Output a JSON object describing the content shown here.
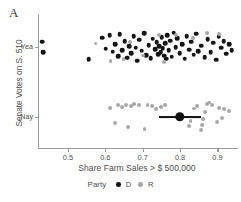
{
  "panel": {
    "label": "A"
  },
  "legend": {
    "title": "Party",
    "position": "bottom",
    "items": [
      {
        "key": "D",
        "label": "D",
        "color": "#151515",
        "name": "Democrat"
      },
      {
        "key": "R",
        "label": "R",
        "color": "#a8a8a8",
        "name": "Republican"
      }
    ]
  },
  "axes": {
    "x": {
      "label": "Share Farm Sales > $ 500,000",
      "ticks": [
        0.5,
        0.6,
        0.7,
        0.8,
        0.9
      ],
      "tick_labels": [
        "0.5",
        "0.6",
        "0.7",
        "0.8",
        "0.9"
      ],
      "range": [
        0.42,
        0.955
      ]
    },
    "y": {
      "label": "Senate Votes on S. 510",
      "ticks": [
        "Yea",
        "Nay"
      ],
      "tick_labels": [
        "Yea",
        "Nay"
      ]
    }
  },
  "colors": {
    "democrat": "#151515",
    "republican": "#a8a8a8",
    "axis": "#9a9a9a",
    "text": "#4d4d4d",
    "estimate": "#111111",
    "background": "#ffffff"
  },
  "chart_data": {
    "type": "scatter",
    "title": "",
    "subtitle": "",
    "xlabel": "Share Farm Sales > $ 500,000",
    "ylabel": "Senate Votes on S. 510",
    "xlim": [
      0.42,
      0.955
    ],
    "ylim": [
      "Nay",
      "Yea"
    ],
    "grid": false,
    "legend": "bottom",
    "y_categories": [
      "Yea",
      "Nay"
    ],
    "series": [
      {
        "name": "D",
        "label": "Democrat",
        "color": "#151515",
        "points": [
          {
            "x": 0.432,
            "y": "Yea",
            "jitter": -0.3
          },
          {
            "x": 0.434,
            "y": "Yea",
            "jitter": 0.32
          },
          {
            "x": 0.556,
            "y": "Yea",
            "jitter": 0.72
          },
          {
            "x": 0.592,
            "y": "Yea",
            "jitter": -0.55
          },
          {
            "x": 0.601,
            "y": "Yea",
            "jitter": 0.1
          },
          {
            "x": 0.612,
            "y": "Yea",
            "jitter": -0.68
          },
          {
            "x": 0.62,
            "y": "Yea",
            "jitter": 0.28
          },
          {
            "x": 0.627,
            "y": "Yea",
            "jitter": -0.18
          },
          {
            "x": 0.634,
            "y": "Yea",
            "jitter": 0.55
          },
          {
            "x": 0.639,
            "y": "Yea",
            "jitter": -0.75
          },
          {
            "x": 0.645,
            "y": "Yea",
            "jitter": 0.18
          },
          {
            "x": 0.652,
            "y": "Yea",
            "jitter": -0.35
          },
          {
            "x": 0.659,
            "y": "Yea",
            "jitter": 0.62
          },
          {
            "x": 0.664,
            "y": "Yea",
            "jitter": -0.05
          },
          {
            "x": 0.67,
            "y": "Yea",
            "jitter": 0.38
          },
          {
            "x": 0.676,
            "y": "Yea",
            "jitter": -0.62
          },
          {
            "x": 0.681,
            "y": "Yea",
            "jitter": 0.05
          },
          {
            "x": 0.686,
            "y": "Yea",
            "jitter": 0.8
          },
          {
            "x": 0.691,
            "y": "Yea",
            "jitter": -0.42
          },
          {
            "x": 0.697,
            "y": "Yea",
            "jitter": 0.22
          },
          {
            "x": 0.704,
            "y": "Yea",
            "jitter": -0.8
          },
          {
            "x": 0.71,
            "y": "Yea",
            "jitter": 0.48
          },
          {
            "x": 0.716,
            "y": "Yea",
            "jitter": -0.12
          },
          {
            "x": 0.722,
            "y": "Yea",
            "jitter": 0.65
          },
          {
            "x": 0.727,
            "y": "Yea",
            "jitter": -0.48
          },
          {
            "x": 0.733,
            "y": "Yea",
            "jitter": 0.12
          },
          {
            "x": 0.737,
            "y": "Yea",
            "jitter": -0.28
          },
          {
            "x": 0.741,
            "y": "Yea",
            "jitter": 0.42
          },
          {
            "x": 0.745,
            "y": "Yea",
            "jitter": -0.05
          },
          {
            "x": 0.748,
            "y": "Yea",
            "jitter": 0.3
          },
          {
            "x": 0.751,
            "y": "Yea",
            "jitter": -0.58
          },
          {
            "x": 0.754,
            "y": "Yea",
            "jitter": 0.08
          },
          {
            "x": 0.757,
            "y": "Yea",
            "jitter": 0.52
          },
          {
            "x": 0.76,
            "y": "Yea",
            "jitter": -0.22
          },
          {
            "x": 0.763,
            "y": "Yea",
            "jitter": 0.7
          },
          {
            "x": 0.766,
            "y": "Yea",
            "jitter": -0.7
          },
          {
            "x": 0.77,
            "y": "Yea",
            "jitter": 0.2
          },
          {
            "x": 0.774,
            "y": "Yea",
            "jitter": -0.38
          },
          {
            "x": 0.778,
            "y": "Yea",
            "jitter": 0.58
          },
          {
            "x": 0.783,
            "y": "Yea",
            "jitter": -0.85
          },
          {
            "x": 0.788,
            "y": "Yea",
            "jitter": 0.0
          },
          {
            "x": 0.793,
            "y": "Yea",
            "jitter": -0.52
          },
          {
            "x": 0.799,
            "y": "Yea",
            "jitter": 0.35
          },
          {
            "x": 0.805,
            "y": "Yea",
            "jitter": -0.15
          },
          {
            "x": 0.812,
            "y": "Yea",
            "jitter": 0.68
          },
          {
            "x": 0.818,
            "y": "Yea",
            "jitter": -0.65
          },
          {
            "x": 0.824,
            "y": "Yea",
            "jitter": 0.15
          },
          {
            "x": 0.83,
            "y": "Yea",
            "jitter": -0.32
          },
          {
            "x": 0.836,
            "y": "Yea",
            "jitter": 0.45
          },
          {
            "x": 0.843,
            "y": "Yea",
            "jitter": -0.78
          },
          {
            "x": 0.849,
            "y": "Yea",
            "jitter": 0.25
          },
          {
            "x": 0.856,
            "y": "Yea",
            "jitter": -0.08
          },
          {
            "x": 0.866,
            "y": "Yea",
            "jitter": 0.6
          },
          {
            "x": 0.874,
            "y": "Yea",
            "jitter": -0.45
          },
          {
            "x": 0.882,
            "y": "Yea",
            "jitter": 0.32
          },
          {
            "x": 0.889,
            "y": "Yea",
            "jitter": -0.25
          },
          {
            "x": 0.896,
            "y": "Yea",
            "jitter": 0.75
          },
          {
            "x": 0.903,
            "y": "Yea",
            "jitter": -0.6
          },
          {
            "x": 0.91,
            "y": "Yea",
            "jitter": 0.05
          },
          {
            "x": 0.917,
            "y": "Yea",
            "jitter": -0.35
          },
          {
            "x": 0.924,
            "y": "Yea",
            "jitter": 0.4
          },
          {
            "x": 0.931,
            "y": "Yea",
            "jitter": -0.15
          },
          {
            "x": 0.938,
            "y": "Yea",
            "jitter": 0.18
          }
        ]
      },
      {
        "name": "R",
        "label": "Republican",
        "color": "#a8a8a8",
        "points": [
          {
            "x": 0.574,
            "y": "Yea",
            "jitter": -0.2
          },
          {
            "x": 0.614,
            "y": "Yea",
            "jitter": 0.85
          },
          {
            "x": 0.649,
            "y": "Yea",
            "jitter": 0.72
          },
          {
            "x": 0.667,
            "y": "Yea",
            "jitter": -0.3
          },
          {
            "x": 0.7,
            "y": "Yea",
            "jitter": 0.5
          },
          {
            "x": 0.744,
            "y": "Yea",
            "jitter": -0.68
          },
          {
            "x": 0.757,
            "y": "Yea",
            "jitter": 0.88
          },
          {
            "x": 0.79,
            "y": "Yea",
            "jitter": -0.72
          },
          {
            "x": 0.835,
            "y": "Yea",
            "jitter": -0.55
          },
          {
            "x": 0.872,
            "y": "Yea",
            "jitter": -0.82
          },
          {
            "x": 0.905,
            "y": "Yea",
            "jitter": -0.78
          },
          {
            "x": 0.612,
            "y": "Nay",
            "jitter": -0.55
          },
          {
            "x": 0.625,
            "y": "Nay",
            "jitter": 0.35
          },
          {
            "x": 0.634,
            "y": "Nay",
            "jitter": -0.7
          },
          {
            "x": 0.645,
            "y": "Nay",
            "jitter": -0.6
          },
          {
            "x": 0.655,
            "y": "Nay",
            "jitter": -0.72
          },
          {
            "x": 0.662,
            "y": "Nay",
            "jitter": 0.6
          },
          {
            "x": 0.67,
            "y": "Nay",
            "jitter": -0.65
          },
          {
            "x": 0.678,
            "y": "Nay",
            "jitter": -0.75
          },
          {
            "x": 0.69,
            "y": "Nay",
            "jitter": -0.68
          },
          {
            "x": 0.705,
            "y": "Nay",
            "jitter": 0.7
          },
          {
            "x": 0.713,
            "y": "Nay",
            "jitter": -0.72
          },
          {
            "x": 0.724,
            "y": "Nay",
            "jitter": -0.62
          },
          {
            "x": 0.736,
            "y": "Nay",
            "jitter": -0.45
          },
          {
            "x": 0.748,
            "y": "Nay",
            "jitter": -0.58
          },
          {
            "x": 0.76,
            "y": "Nay",
            "jitter": -0.7
          },
          {
            "x": 0.823,
            "y": "Nay",
            "jitter": 0.55
          },
          {
            "x": 0.828,
            "y": "Nay",
            "jitter": 0.25
          },
          {
            "x": 0.838,
            "y": "Nay",
            "jitter": -0.5
          },
          {
            "x": 0.845,
            "y": "Nay",
            "jitter": -0.62
          },
          {
            "x": 0.856,
            "y": "Nay",
            "jitter": 0.78
          },
          {
            "x": 0.86,
            "y": "Nay",
            "jitter": 0.45
          },
          {
            "x": 0.862,
            "y": "Nay",
            "jitter": 0.12
          },
          {
            "x": 0.866,
            "y": "Nay",
            "jitter": -0.3
          },
          {
            "x": 0.872,
            "y": "Nay",
            "jitter": -0.78
          },
          {
            "x": 0.878,
            "y": "Nay",
            "jitter": -0.85
          },
          {
            "x": 0.886,
            "y": "Nay",
            "jitter": -0.72
          },
          {
            "x": 0.898,
            "y": "Nay",
            "jitter": 0.3
          },
          {
            "x": 0.905,
            "y": "Nay",
            "jitter": -0.52
          },
          {
            "x": 0.912,
            "y": "Nay",
            "jitter": 0.05
          },
          {
            "x": 0.918,
            "y": "Nay",
            "jitter": -0.48
          },
          {
            "x": 0.93,
            "y": "Nay",
            "jitter": -0.35
          }
        ]
      }
    ],
    "estimate": {
      "label": "point-estimate",
      "x": 0.8,
      "y": "Nay",
      "ci_low": 0.745,
      "ci_high": 0.855,
      "color": "#111111"
    }
  }
}
